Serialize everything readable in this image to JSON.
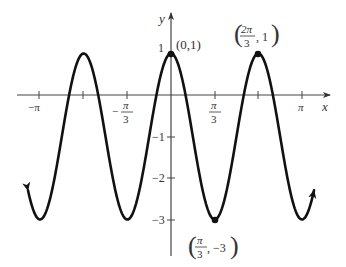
{
  "chart_data": {
    "type": "line",
    "title": "",
    "function": "y = 2cos(3x) - 1",
    "xlabel": "x",
    "ylabel": "y",
    "xlim": [
      -3.4,
      3.8
    ],
    "ylim": [
      -3.85,
      2.1
    ],
    "grid": false,
    "x_ticks": [
      {
        "value": -3.14159,
        "label": "−π"
      },
      {
        "value": -2.0944,
        "label": ""
      },
      {
        "value": -1.0472,
        "label": "−π/3"
      },
      {
        "value": 1.0472,
        "label": "π/3"
      },
      {
        "value": 2.0944,
        "label": ""
      },
      {
        "value": 3.14159,
        "label": "π"
      }
    ],
    "y_ticks": [
      {
        "value": 1,
        "label": "1"
      },
      {
        "value": -1,
        "label": "−1"
      },
      {
        "value": -2,
        "label": "−2"
      },
      {
        "value": -3,
        "label": "−3"
      }
    ],
    "x_range_curve": [
      -3.43,
      3.43
    ],
    "series": [
      {
        "name": "2cos(3x) - 1",
        "color": "#111111",
        "x": [
          -3.14159,
          -2.0944,
          -1.0472,
          0,
          1.0472,
          2.0944,
          3.14159
        ],
        "y": [
          -3,
          1,
          -3,
          1,
          -3,
          1,
          -3
        ]
      }
    ],
    "annotations": [
      {
        "text": "(0,1)",
        "x": 0,
        "y": 1
      },
      {
        "text": "(2π/3, 1)",
        "x": 2.0944,
        "y": 1
      },
      {
        "text": "(π/3, −3)",
        "x": 1.0472,
        "y": -3
      }
    ]
  },
  "labels": {
    "x_axis": "x",
    "y_axis": "y",
    "neg_pi": "−π",
    "neg_pi_over_3_num": "π",
    "neg_pi_over_3_den": "3",
    "neg_sign": "−",
    "pi_over_3_num": "π",
    "pi_over_3_den": "3",
    "pi": "π",
    "y1": "1",
    "ym1": "−1",
    "ym2": "−2",
    "ym3": "−3",
    "pt_origin_max": "(0,1)",
    "pt_max2_num": "2π",
    "pt_max2_den": "3",
    "pt_max2_y": ", 1",
    "pt_min_num": "π",
    "pt_min_den": "3",
    "pt_min_y": ", −3"
  }
}
